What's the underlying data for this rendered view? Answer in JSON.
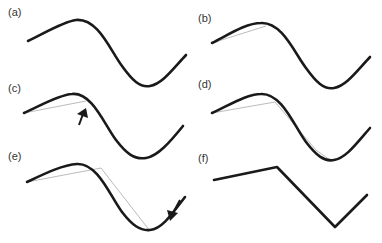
{
  "panels": [
    {
      "label": "(a)",
      "description": "smooth curve"
    },
    {
      "label": "(b)",
      "description": "first chord from start to near peak"
    },
    {
      "label": "(c)",
      "description": "chord with arrow marking max deviation point"
    },
    {
      "label": "(d)",
      "description": "chords subdivided through peak to valley"
    },
    {
      "label": "(e)",
      "description": "chord with arrow marking deviation near valley"
    },
    {
      "label": "(f)",
      "description": "final polyline approximation"
    }
  ],
  "colors": {
    "curve": "#1a1a1a",
    "chord": "#aaaaaa",
    "arrow": "#1a1a1a"
  }
}
